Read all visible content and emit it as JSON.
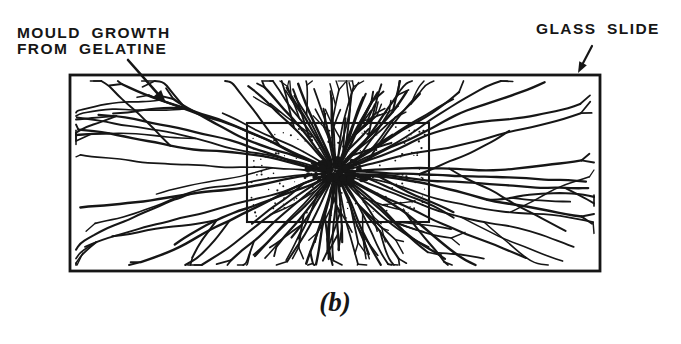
{
  "figure": {
    "caption": "(b)",
    "mould_label": {
      "line1": "MOULD GROWTH",
      "line2": "FROM GELATINE"
    },
    "slide_label": "GLASS SLIDE",
    "colors": {
      "ink": "#161616",
      "paper": "#ffffff"
    },
    "geometry": {
      "canvas": {
        "width": 681,
        "height": 344
      },
      "glass_slide_rect": {
        "x": 70,
        "y": 75,
        "width": 530,
        "height": 196,
        "stroke_width": 2.8
      },
      "gelatine_rect": {
        "x": 247,
        "y": 123,
        "width": 182,
        "height": 99,
        "stroke_width": 2.1
      },
      "growth_center": {
        "x": 336,
        "y": 172
      },
      "mould_arrow": {
        "x1": 128,
        "y1": 60,
        "x2": 166,
        "y2": 103
      },
      "slide_arrow": {
        "x1": 592,
        "y1": 46,
        "x2": 578,
        "y2": 73
      }
    },
    "filaments": {
      "count": 68,
      "seed": 11
    }
  }
}
